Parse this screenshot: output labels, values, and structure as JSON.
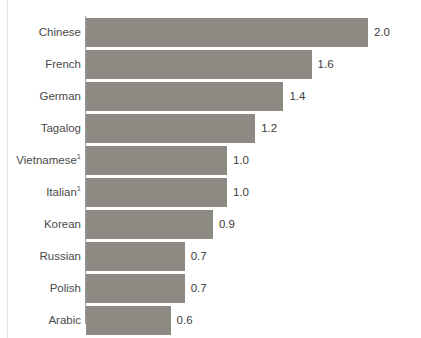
{
  "chart_data": {
    "type": "bar",
    "orientation": "horizontal",
    "title": "",
    "xlabel": "",
    "ylabel": "",
    "grid": false,
    "legend": null,
    "xlim": [
      0,
      2.0
    ],
    "categories": [
      "Chinese",
      "French",
      "German",
      "Tagalog",
      "Vietnamese",
      "Italian",
      "Korean",
      "Russian",
      "Polish",
      "Arabic"
    ],
    "values": [
      2.0,
      1.6,
      1.4,
      1.2,
      1.0,
      1.0,
      0.9,
      0.7,
      0.7,
      0.6
    ],
    "data_labels": [
      "2.0",
      "1.6",
      "1.4",
      "1.2",
      "1.0",
      "1.0",
      "0.9",
      "0.7",
      "0.7",
      "0.6"
    ],
    "footnote_markers": {
      "Vietnamese": "1",
      "Italian": "1"
    },
    "colors": {
      "bar": "#8d8a84",
      "label_text": "#4a4a4a",
      "value_text": "#3c3c3c",
      "axis_line": "#9a9a9a",
      "border_rule": "#e6e6e8",
      "background": "#ffffff"
    }
  },
  "rows": [
    {
      "label": "Chinese",
      "marker": "",
      "value": 2.0,
      "display": "2.0"
    },
    {
      "label": "French",
      "marker": "",
      "value": 1.6,
      "display": "1.6"
    },
    {
      "label": "German",
      "marker": "",
      "value": 1.4,
      "display": "1.4"
    },
    {
      "label": "Tagalog",
      "marker": "",
      "value": 1.2,
      "display": "1.2"
    },
    {
      "label": "Vietnamese",
      "marker": "1",
      "value": 1.0,
      "display": "1.0"
    },
    {
      "label": "Italian",
      "marker": "1",
      "value": 1.0,
      "display": "1.0"
    },
    {
      "label": "Korean",
      "marker": "",
      "value": 0.9,
      "display": "0.9"
    },
    {
      "label": "Russian",
      "marker": "",
      "value": 0.7,
      "display": "0.7"
    },
    {
      "label": "Polish",
      "marker": "",
      "value": 0.7,
      "display": "0.7"
    },
    {
      "label": "Arabic",
      "marker": "",
      "value": 0.6,
      "display": "0.6"
    }
  ],
  "clipped_header": {
    "text": ""
  }
}
